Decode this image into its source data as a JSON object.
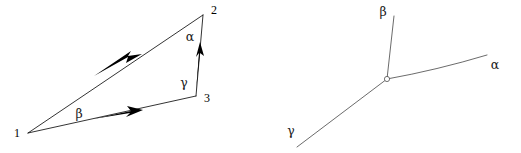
{
  "figure": {
    "background_color": "#ffffff",
    "stroke_color": "#000000",
    "panels": [
      {
        "id": "triangle-panel",
        "name": "closed-traverse-triangle",
        "vertices": [
          {
            "id": "v1",
            "label": "1",
            "x": 28,
            "y": 133,
            "label_x": 17,
            "label_y": 134
          },
          {
            "id": "v2",
            "label": "2",
            "x": 203,
            "y": 15,
            "label_x": 214,
            "label_y": 11
          },
          {
            "id": "v3",
            "label": "3",
            "x": 196,
            "y": 96,
            "label_x": 207,
            "label_y": 99
          }
        ],
        "angles": [
          {
            "id": "alpha-angle",
            "label": "α",
            "at_vertex": "2",
            "x": 190,
            "y": 37
          },
          {
            "id": "beta-angle",
            "label": "β",
            "at_vertex": "1",
            "x": 79,
            "y": 114
          },
          {
            "id": "gamma-angle",
            "label": "γ",
            "at_vertex": "3",
            "x": 184,
            "y": 83
          }
        ],
        "edges": [
          {
            "id": "edge-1-2",
            "from": "1",
            "to": "2",
            "direction": "2-to-1",
            "arrow": true
          },
          {
            "id": "edge-1-3",
            "from": "1",
            "to": "3",
            "direction": "1-to-3",
            "arrow": true
          },
          {
            "id": "edge-3-2",
            "from": "3",
            "to": "2",
            "direction": "3-to-2",
            "arrow": true
          }
        ]
      },
      {
        "id": "junction-panel",
        "name": "three-ray-junction",
        "node": {
          "id": "junction-node",
          "x": 387,
          "y": 79
        },
        "rays": [
          {
            "id": "ray-alpha",
            "label": "α",
            "end_x": 487,
            "end_y": 55,
            "label_x": 495,
            "label_y": 65,
            "curved": true
          },
          {
            "id": "ray-beta",
            "label": "β",
            "end_x": 394,
            "end_y": 16,
            "label_x": 383,
            "label_y": 12,
            "curved": false
          },
          {
            "id": "ray-gamma",
            "label": "γ",
            "end_x": 297,
            "end_y": 147,
            "label_x": 291,
            "label_y": 131,
            "curved": false
          }
        ]
      }
    ]
  }
}
